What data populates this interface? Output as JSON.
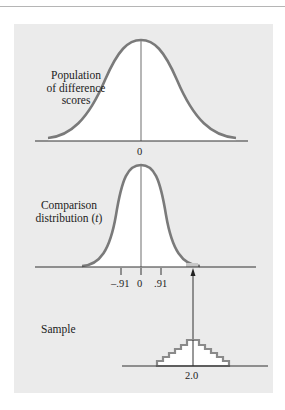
{
  "diagram": {
    "panels": [
      {
        "id": "population",
        "label_lines": [
          "Population",
          "of difference",
          "scores"
        ],
        "axis_ticks": [
          "0"
        ]
      },
      {
        "id": "comparison",
        "label_line1": "Comparison",
        "label_line2_text": "distribution (",
        "label_line2_italic": "t",
        "label_line2_close": ")",
        "axis_ticks": [
          "–.91",
          "0",
          ".91"
        ]
      },
      {
        "id": "sample",
        "label": "Sample",
        "axis_ticks": [
          "2.0"
        ]
      }
    ],
    "colors": {
      "curve": "#7a7a7a",
      "background": "#ebebeb",
      "fill": "#ffffff",
      "axis": "#333333"
    }
  }
}
